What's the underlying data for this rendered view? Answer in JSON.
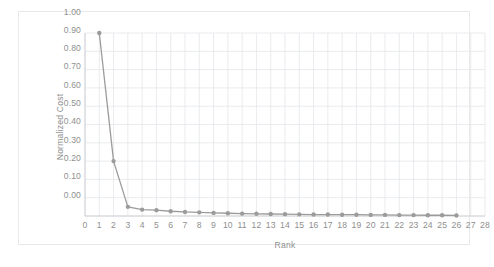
{
  "chart_data": {
    "type": "line",
    "title": "",
    "xlabel": "Rank",
    "ylabel": "Normalized Cost",
    "xlim": [
      0,
      28
    ],
    "ylim": [
      0,
      1.0
    ],
    "grid": true,
    "legend": false,
    "legend_position": "none",
    "marker": "circle",
    "series_color": "#9b9b9b",
    "grid_color": "#e4e6ea",
    "axis_color": "#d0d2d6",
    "text_color": "#8f8f8f",
    "x_tick_labels": [
      "0",
      "1",
      "2",
      "3",
      "4",
      "5",
      "6",
      "7",
      "8",
      "9",
      "10",
      "11",
      "12",
      "13",
      "14",
      "15",
      "16",
      "17",
      "18",
      "19",
      "20",
      "21",
      "22",
      "23",
      "24",
      "25",
      "26",
      "27",
      "28"
    ],
    "x_ticks": [
      0,
      1,
      2,
      3,
      4,
      5,
      6,
      7,
      8,
      9,
      10,
      11,
      12,
      13,
      14,
      15,
      16,
      17,
      18,
      19,
      20,
      21,
      22,
      23,
      24,
      25,
      26,
      27,
      28
    ],
    "y_tick_labels": [
      "0.00",
      "0.10",
      "0.20",
      "0.30",
      "0.40",
      "0.50",
      "0.60",
      "0.70",
      "0.80",
      "0.90",
      "1.00"
    ],
    "y_ticks": [
      0,
      0.1,
      0.2,
      0.3,
      0.4,
      0.5,
      0.6,
      0.7,
      0.8,
      0.9,
      1.0
    ],
    "x": [
      1,
      2,
      3,
      4,
      5,
      6,
      7,
      8,
      9,
      10,
      11,
      12,
      13,
      14,
      15,
      16,
      17,
      18,
      19,
      20,
      21,
      22,
      23,
      24,
      25,
      26
    ],
    "values": [
      1.0,
      0.3,
      0.05,
      0.035,
      0.032,
      0.026,
      0.022,
      0.02,
      0.017,
      0.015,
      0.013,
      0.012,
      0.011,
      0.01,
      0.009,
      0.008,
      0.008,
      0.007,
      0.007,
      0.006,
      0.006,
      0.005,
      0.005,
      0.004,
      0.004,
      0.003
    ],
    "series": [
      {
        "name": "Normalized Cost",
        "values": [
          1.0,
          0.3,
          0.05,
          0.035,
          0.032,
          0.026,
          0.022,
          0.02,
          0.017,
          0.015,
          0.013,
          0.012,
          0.011,
          0.01,
          0.009,
          0.008,
          0.008,
          0.007,
          0.007,
          0.006,
          0.006,
          0.005,
          0.005,
          0.004,
          0.004,
          0.003
        ]
      }
    ]
  }
}
